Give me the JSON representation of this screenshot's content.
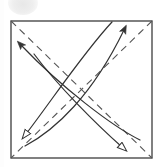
{
  "figure": {
    "background_color": "#ffffff",
    "line_color": "#3a3a3a",
    "dash_color": "#555555",
    "smudge_color": "#ececec"
  },
  "square": {
    "name": "paper-square",
    "x": 11,
    "y": 21,
    "width": 141,
    "height": 137,
    "stroke": "#4a4a4a",
    "stroke_width": 1.4,
    "fill": "#ffffff"
  },
  "fold_lines": [
    {
      "name": "diagonal-fold-tl-br",
      "from_x": 11,
      "from_y": 21,
      "to_x": 152,
      "to_y": 158,
      "style": "dashed",
      "dash_pattern": "7 5",
      "stroke": "#555555",
      "stroke_width": 1.1
    },
    {
      "name": "diagonal-fold-tr-bl",
      "from_x": 152,
      "from_y": 21,
      "to_x": 11,
      "to_y": 158,
      "style": "dashed",
      "dash_pattern": "7 5",
      "stroke": "#555555",
      "stroke_width": 1.1
    }
  ],
  "arrows": [
    {
      "name": "arrow-up-right",
      "label": "fold up-right",
      "head_style": "solid",
      "path": "M 25 146 C 55 130, 92 96, 124 30",
      "tip_x": 124,
      "tip_y": 30,
      "stroke": "#333333",
      "stroke_width": 1.2
    },
    {
      "name": "arrow-up-left",
      "label": "fold up-left",
      "head_style": "solid",
      "path": "M 140 140 C 112 126, 62 88, 21 45",
      "tip_x": 21,
      "tip_y": 45,
      "stroke": "#333333",
      "stroke_width": 1.2
    },
    {
      "name": "arrow-down-left",
      "label": "unfold down-left",
      "head_style": "hollow",
      "path": "M 112 22 C 84 52, 52 100, 26 134",
      "tip_x": 20,
      "tip_y": 141,
      "stroke": "#333333",
      "stroke_width": 1.2
    },
    {
      "name": "arrow-down-right",
      "label": "unfold down-right",
      "head_style": "hollow",
      "path": "M 34 54 C 58 86, 96 124, 122 147",
      "tip_x": 128,
      "tip_y": 153,
      "stroke": "#333333",
      "stroke_width": 1.2
    }
  ],
  "artifacts": {
    "smudge_top_left": {
      "name": "scan-smudge",
      "visible": true
    }
  }
}
